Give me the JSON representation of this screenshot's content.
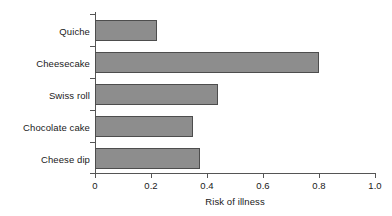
{
  "chart_data": {
    "type": "bar",
    "orientation": "horizontal",
    "title": "",
    "xlabel": "Risk of illness",
    "ylabel": "",
    "categories": [
      "Quiche",
      "Cheesecake",
      "Swiss roll",
      "Chocolate cake",
      "Cheese dip"
    ],
    "values": [
      0.22,
      0.8,
      0.44,
      0.35,
      0.375
    ],
    "xlim": [
      0,
      1.0
    ],
    "xticks": [
      0,
      0.2,
      0.4,
      0.6,
      0.8,
      1.0
    ],
    "xtick_labels": [
      "0",
      "0.2",
      "0.4",
      "0.6",
      "0.8",
      "1.0"
    ],
    "grid": false,
    "legend": null,
    "bar_fill_color": "#8d8d8d",
    "bar_edge_color": "#4d4d4d",
    "axis_color": "#555555",
    "background_color": "#ffffff",
    "bars": [
      {
        "category": "Quiche",
        "value": 0.22
      },
      {
        "category": "Cheesecake",
        "value": 0.8
      },
      {
        "category": "Swiss roll",
        "value": 0.44
      },
      {
        "category": "Chocolate cake",
        "value": 0.35
      },
      {
        "category": "Cheese dip",
        "value": 0.375
      }
    ]
  }
}
